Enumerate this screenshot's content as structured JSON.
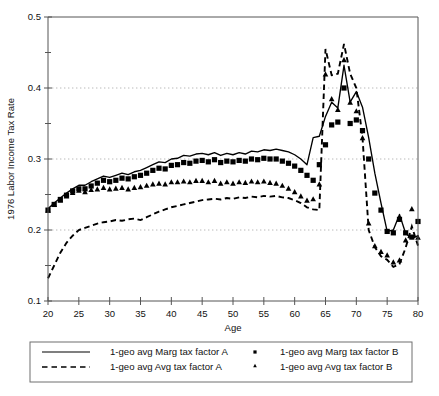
{
  "chart_data": {
    "type": "line",
    "title": "",
    "xlabel": "Age",
    "ylabel": "1976 Labor Income Tax Rate",
    "xlim": [
      20,
      80
    ],
    "ylim": [
      0.1,
      0.5
    ],
    "xticks": [
      20,
      25,
      30,
      35,
      40,
      45,
      50,
      55,
      60,
      65,
      70,
      75,
      80
    ],
    "xticklabels": [
      "20",
      "25",
      "30",
      "35",
      "40",
      "45",
      "50",
      "55",
      "60",
      "65",
      "70",
      "75",
      "80"
    ],
    "yticks": [
      0.1,
      0.2,
      0.3,
      0.4,
      0.5
    ],
    "yticklabels": [
      "0.1",
      "0.2",
      "0.3",
      "0.4",
      "0.5"
    ],
    "yminorticks": [
      0.15,
      0.25,
      0.35,
      0.45
    ],
    "grid": "horizontal-dotted at 0.2, 0.3, 0.4",
    "gridlines": [
      0.2,
      0.3,
      0.4
    ],
    "legend_position": "below-axes",
    "x": [
      20,
      21,
      22,
      23,
      24,
      25,
      26,
      27,
      28,
      29,
      30,
      31,
      32,
      33,
      34,
      35,
      36,
      37,
      38,
      39,
      40,
      41,
      42,
      43,
      44,
      45,
      46,
      47,
      48,
      49,
      50,
      51,
      52,
      53,
      54,
      55,
      56,
      57,
      58,
      59,
      60,
      61,
      62,
      63,
      64,
      65,
      66,
      67,
      68,
      69,
      70,
      71,
      72,
      73,
      74,
      75,
      76,
      77,
      78,
      79,
      80
    ],
    "series": [
      {
        "name": "1-geo avg Marg tax factor A",
        "style": "solid-line",
        "color": "#000000",
        "values": [
          0.23,
          0.238,
          0.245,
          0.252,
          0.258,
          0.263,
          0.263,
          0.268,
          0.272,
          0.276,
          0.274,
          0.277,
          0.28,
          0.278,
          0.282,
          0.284,
          0.288,
          0.292,
          0.296,
          0.295,
          0.3,
          0.301,
          0.305,
          0.304,
          0.307,
          0.308,
          0.306,
          0.309,
          0.305,
          0.308,
          0.306,
          0.309,
          0.307,
          0.311,
          0.31,
          0.313,
          0.312,
          0.314,
          0.312,
          0.31,
          0.306,
          0.3,
          0.292,
          0.33,
          0.332,
          0.36,
          0.38,
          0.372,
          0.432,
          0.38,
          0.395,
          0.373,
          0.33,
          0.28,
          0.238,
          0.198,
          0.2,
          0.222,
          0.195,
          0.188,
          0.192
        ]
      },
      {
        "name": "1-geo avg Avg tax factor A",
        "style": "dashed-line",
        "color": "#000000",
        "values": [
          0.132,
          0.15,
          0.168,
          0.182,
          0.192,
          0.2,
          0.203,
          0.206,
          0.209,
          0.211,
          0.212,
          0.214,
          0.213,
          0.215,
          0.216,
          0.214,
          0.218,
          0.222,
          0.226,
          0.229,
          0.232,
          0.234,
          0.236,
          0.238,
          0.24,
          0.242,
          0.243,
          0.244,
          0.243,
          0.245,
          0.244,
          0.246,
          0.245,
          0.247,
          0.246,
          0.248,
          0.247,
          0.248,
          0.246,
          0.245,
          0.242,
          0.238,
          0.232,
          0.229,
          0.228,
          0.455,
          0.418,
          0.42,
          0.462,
          0.42,
          0.4,
          0.33,
          0.2,
          0.176,
          0.163,
          0.158,
          0.148,
          0.152,
          0.175,
          0.205,
          0.178
        ]
      },
      {
        "name": "1-geo avg Marg tax factor B",
        "style": "square-markers",
        "color": "#000000",
        "values": [
          0.228,
          0.236,
          0.243,
          0.249,
          0.255,
          0.258,
          0.258,
          0.262,
          0.266,
          0.27,
          0.268,
          0.27,
          0.273,
          0.272,
          0.275,
          0.277,
          0.28,
          0.284,
          0.287,
          0.286,
          0.291,
          0.292,
          0.295,
          0.294,
          0.297,
          0.298,
          0.296,
          0.299,
          0.295,
          0.297,
          0.296,
          0.298,
          0.297,
          0.3,
          0.299,
          0.301,
          0.3,
          0.3,
          0.297,
          0.294,
          0.29,
          0.284,
          0.277,
          0.27,
          0.292,
          0.32,
          0.348,
          0.352,
          0.4,
          0.35,
          0.355,
          0.34,
          0.3,
          0.252,
          0.228,
          0.198,
          0.196,
          0.215,
          0.196,
          0.19,
          0.212
        ]
      },
      {
        "name": "1-geo avg Avg tax factor B",
        "style": "triangle-markers",
        "color": "#000000",
        "values": [
          0.228,
          0.236,
          0.242,
          0.248,
          0.253,
          0.256,
          0.254,
          0.257,
          0.258,
          0.26,
          0.258,
          0.259,
          0.26,
          0.258,
          0.26,
          0.261,
          0.263,
          0.265,
          0.266,
          0.265,
          0.268,
          0.268,
          0.269,
          0.268,
          0.27,
          0.27,
          0.268,
          0.27,
          0.266,
          0.268,
          0.266,
          0.268,
          0.267,
          0.269,
          0.268,
          0.269,
          0.267,
          0.266,
          0.263,
          0.259,
          0.254,
          0.248,
          0.242,
          0.244,
          0.265,
          0.42,
          0.385,
          0.37,
          0.44,
          0.38,
          0.368,
          0.33,
          0.21,
          0.178,
          0.17,
          0.165,
          0.155,
          0.158,
          0.186,
          0.23,
          0.19
        ]
      }
    ]
  },
  "legend": {
    "entries": [
      {
        "label": "1-geo avg Marg tax factor A",
        "marker": "solid-line"
      },
      {
        "label": "1-geo avg Marg tax factor B",
        "marker": "square-dot"
      },
      {
        "label": "1-geo avg Avg tax factor A",
        "marker": "dashed-line"
      },
      {
        "label": "1-geo avg Avg tax factor B",
        "marker": "triangle-dot"
      }
    ]
  }
}
